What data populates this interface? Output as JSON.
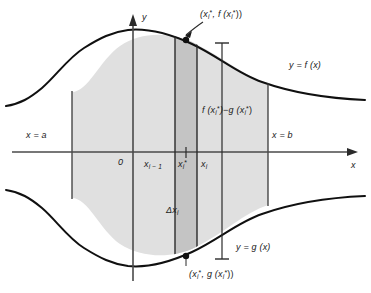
{
  "figure": {
    "axes": {
      "y_axis_label": "y",
      "x_axis_label": "x",
      "origin_label": "0"
    },
    "curves": [
      {
        "id": "upper",
        "label_text": "y = f (x)",
        "name": "upper-curve-f"
      },
      {
        "id": "lower",
        "label_text": "y = g (x)",
        "name": "lower-curve-g"
      }
    ],
    "boundaries": [
      {
        "id": "left",
        "label_text": "x = a",
        "name": "left-boundary-a"
      },
      {
        "id": "right",
        "label_text": "x = b",
        "name": "right-boundary-b"
      }
    ],
    "tick_labels": [
      {
        "id": "x-i-minus-1",
        "text": "x",
        "sub": "i − 1",
        "sup": ""
      },
      {
        "id": "x-i-star",
        "text": "x",
        "sub": "i",
        "sup": "*"
      },
      {
        "id": "x-i",
        "text": "x",
        "sub": "i",
        "sup": ""
      }
    ],
    "annotations": {
      "top_point": {
        "prefix": "(x",
        "sub1": "i",
        "sup1": "*",
        "mid": ", f (x",
        "sub2": "i",
        "sup2": "*",
        "suffix": "))"
      },
      "bottom_point": {
        "prefix": "(x",
        "sub1": "i",
        "sup1": "*",
        "mid": ", g (x",
        "sub2": "i",
        "sup2": "*",
        "suffix": "))"
      },
      "height_label": {
        "prefix": "f (x",
        "sub1": "i",
        "sup1": "*",
        "mid": ")−g (x",
        "sub2": "i",
        "sup2": "*",
        "suffix": ")"
      },
      "width_label": {
        "prefix": "Δx",
        "sub1": "i"
      }
    },
    "colors": {
      "region_fill": "#e0e0e0",
      "strip_fill": "#c4c4c4",
      "curve_stroke": "#101010",
      "axis_stroke": "#4a4a4a",
      "rule_stroke": "#3a3a3a",
      "text": "#1a1a1a",
      "background": "#ffffff"
    }
  }
}
